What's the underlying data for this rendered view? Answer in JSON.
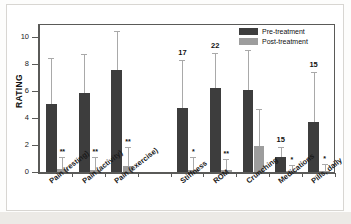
{
  "chart_data": {
    "type": "bar",
    "title": "",
    "xlabel": "",
    "ylabel": "RATING",
    "ylim": [
      0,
      11
    ],
    "yticks": [
      0,
      2,
      4,
      6,
      8,
      10
    ],
    "ytick_labels": [
      "0",
      "2",
      "4",
      "6",
      "8",
      "10"
    ],
    "grid": false,
    "legend_position": "top-right",
    "categories": [
      "Pain (resting)",
      "Pain (activity)",
      "Pain (exercise)",
      "",
      "Stiffness",
      "ROM",
      "Crunching",
      "Medications",
      "Pills, daily"
    ],
    "series": [
      {
        "name": "Pre-treatment",
        "color": "#3d3d3d",
        "values": [
          5.05,
          5.9,
          7.55,
          null,
          4.75,
          6.25,
          6.1,
          1.1,
          3.75
        ],
        "errors_upper": [
          8.5,
          8.75,
          10.5,
          null,
          8.3,
          8.85,
          9.05,
          1.85,
          7.4
        ]
      },
      {
        "name": "Post-treatment",
        "color": "#9d9d9d",
        "values": [
          0.22,
          0.18,
          0.45,
          null,
          0.15,
          0.18,
          1.9,
          0.05,
          0.05
        ],
        "errors_upper": [
          1.15,
          1.1,
          1.85,
          null,
          1.1,
          0.95,
          4.7,
          0.55,
          0.6
        ]
      }
    ],
    "significance_markers": [
      "**",
      "**",
      "**",
      null,
      "*",
      "**",
      null,
      "*",
      "*"
    ],
    "group_counts": [
      null,
      null,
      null,
      null,
      "17",
      "22",
      "21",
      "15",
      "15"
    ]
  },
  "legend": {
    "entries": [
      {
        "label": "Pre-treatment",
        "color": "#3d3d3d"
      },
      {
        "label": "Post-treatment",
        "color": "#9d9d9d"
      }
    ]
  }
}
